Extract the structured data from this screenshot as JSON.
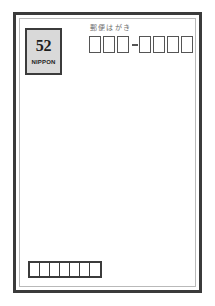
{
  "document": {
    "kind": "japanese-postcard",
    "caption": "郵便はがき",
    "background_color": "#ffffff",
    "border_color": "#3b3b3b",
    "inner_rule_color": "#b9b9b9"
  },
  "stamp": {
    "value": "52",
    "country": "NIPPON",
    "fill_color": "#d9d9d9",
    "border_color": "#3b3b3b"
  },
  "postal_code": {
    "cell_count": 7,
    "separator_after": 3,
    "cells": [
      "",
      "",
      "",
      "",
      "",
      "",
      ""
    ],
    "cell_border_color": "#555555",
    "separator_glyph": "-"
  },
  "bottom_bar": {
    "cell_count": 7,
    "cells": [
      "",
      "",
      "",
      "",
      "",
      "",
      ""
    ],
    "border_color": "#3b3b3b"
  }
}
